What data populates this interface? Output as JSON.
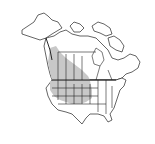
{
  "map": {
    "type": "species-range-map",
    "region": "North America",
    "colors": {
      "background": "#ffffff",
      "land": "#ffffff",
      "outline": "#222222",
      "range_fill": "#c8c8c8"
    },
    "range_areas": [
      "British Columbia (interior)",
      "Alberta",
      "Saskatchewan (southern)",
      "Washington",
      "Oregon",
      "Idaho",
      "Montana",
      "Wyoming",
      "North Dakota",
      "South Dakota",
      "Nevada",
      "Utah",
      "Colorado",
      "Nebraska",
      "Kansas (western)"
    ]
  }
}
